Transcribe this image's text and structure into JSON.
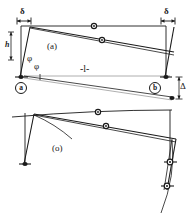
{
  "figure": {
    "background_color": "#ffffff",
    "line_color": "#1a1a1a",
    "faint_line_color": "#9a9a9a",
    "panels": [
      {
        "id": "panel-a",
        "label": "(a)",
        "description": "Portal frame with sway displacement, undeformed outline and deformed shape"
      },
      {
        "id": "panel-sigma",
        "label": "(o)",
        "description": "Deformed frame with curved column and node markers"
      }
    ],
    "labels": {
      "sway_left": "δ",
      "sway_right": "δ",
      "height": "h",
      "length": "-l-",
      "rotation_upper": "φ",
      "rotation_lower": "φ",
      "vertical_drop": "Δ",
      "panel_a": "(a)",
      "panel_sigma": "(o)",
      "support_left": "a",
      "support_right": "b"
    }
  }
}
